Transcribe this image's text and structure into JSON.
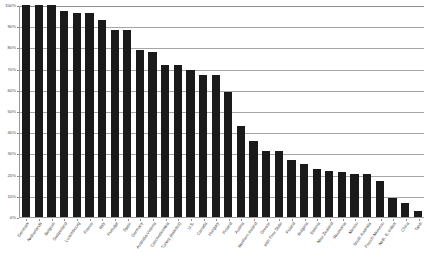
{
  "chart_data": {
    "type": "bar",
    "title": "",
    "subtitle": "",
    "xlabel": "",
    "ylabel": "",
    "ylim": [
      0,
      100
    ],
    "ytick_labels": [
      "0%",
      "10%",
      "20%",
      "30%",
      "40%",
      "50%",
      "60%",
      "70%",
      "80%",
      "90%",
      "100%"
    ],
    "ytick_values": [
      0,
      10,
      20,
      30,
      40,
      50,
      60,
      70,
      80,
      90,
      100
    ],
    "grid": true,
    "legend": "none",
    "bar_color": "#1a1a1a",
    "orientation": "vertical",
    "categories": [
      "Denmark",
      "Netherlands",
      "Belgium",
      "Switzerland",
      "Luxembourg",
      "France",
      "Italy",
      "Portugal",
      "Spain",
      "Germany",
      "Australia-Victoria",
      "Czechoslovakia",
      "Turkey (Istanbul)",
      "U.S.",
      "Canada",
      "Hungary",
      "Finland",
      "Austria",
      "Northern Ireland",
      "Greece",
      "Irish Free State",
      "Poland",
      "Bulgaria",
      "Estonia",
      "New Zealand",
      "Roumania",
      "Mexico",
      "South Australia",
      "French Morocco",
      "Neth. E. Indies",
      "China",
      "Tahiti"
    ],
    "values": [
      100,
      100,
      100,
      97,
      96,
      96,
      93,
      88,
      88,
      79,
      78,
      71.5,
      71.5,
      69.5,
      67,
      67,
      59,
      43,
      36,
      31,
      31,
      27,
      25,
      22.5,
      21.5,
      21,
      20.5,
      20.5,
      17,
      9,
      6.5,
      3
    ],
    "value_unit": "percent"
  }
}
